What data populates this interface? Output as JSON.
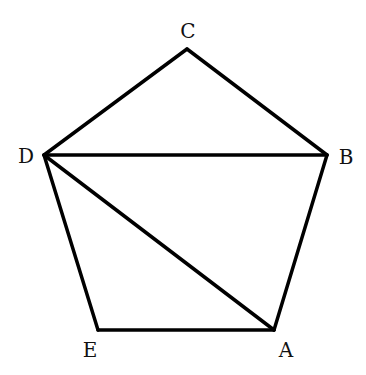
{
  "diagram": {
    "type": "geometry-figure",
    "stroke_color": "#000000",
    "vertices": [
      {
        "id": "A",
        "label": "A",
        "x": 274,
        "y": 330,
        "label_x": 286,
        "label_y": 350
      },
      {
        "id": "B",
        "label": "B",
        "x": 327,
        "y": 155,
        "label_x": 346,
        "label_y": 157
      },
      {
        "id": "C",
        "label": "C",
        "x": 187,
        "y": 49,
        "label_x": 188,
        "label_y": 31
      },
      {
        "id": "D",
        "label": "D",
        "x": 44,
        "y": 155,
        "label_x": 26,
        "label_y": 156
      },
      {
        "id": "E",
        "label": "E",
        "x": 98,
        "y": 330,
        "label_x": 90,
        "label_y": 350
      }
    ],
    "edges": [
      {
        "from": "A",
        "to": "B",
        "kind": "side"
      },
      {
        "from": "B",
        "to": "C",
        "kind": "side"
      },
      {
        "from": "C",
        "to": "D",
        "kind": "side"
      },
      {
        "from": "D",
        "to": "E",
        "kind": "side"
      },
      {
        "from": "E",
        "to": "A",
        "kind": "side"
      },
      {
        "from": "D",
        "to": "B",
        "kind": "diagonal"
      },
      {
        "from": "D",
        "to": "A",
        "kind": "diagonal"
      }
    ]
  }
}
